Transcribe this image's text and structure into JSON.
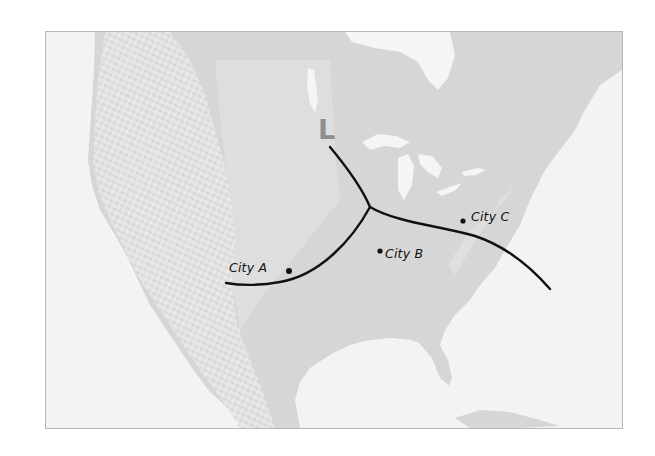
{
  "map": {
    "type": "weather-front-map",
    "region": "North America (shaded relief, grayscale)",
    "colors": {
      "ocean": "#f3f3f3",
      "land": "#d3d3d3",
      "land_light": "#e0e0e0",
      "mountains": "#e6e6e6",
      "lakes": "#f5f5f5",
      "front_line": "#111111",
      "pressure_label": "#8e8e8e",
      "frame": "#b9b9b9"
    },
    "pressure_system": {
      "label": "L",
      "x": 318,
      "y": 116
    },
    "fronts": [
      {
        "name": "north-branch",
        "path": "M330 147 C 345 165, 362 188, 370 207"
      },
      {
        "name": "southwest-branch",
        "path": "M370 207 C 352 240, 320 275, 280 282 C 258 286, 238 285, 226 283"
      },
      {
        "name": "east-branch",
        "path": "M370 207 C 395 222, 440 226, 475 236 C 505 246, 530 266, 550 289"
      }
    ],
    "cities": [
      {
        "name": "City A",
        "dot": {
          "x": 289,
          "y": 271
        },
        "label_x": 229,
        "label_y": 262
      },
      {
        "name": "City B",
        "dot": {
          "x": 380,
          "y": 251
        },
        "label_x": 385,
        "label_y": 249
      },
      {
        "name": "City C",
        "dot": {
          "x": 463,
          "y": 221
        },
        "label_x": 471,
        "label_y": 211
      }
    ]
  }
}
